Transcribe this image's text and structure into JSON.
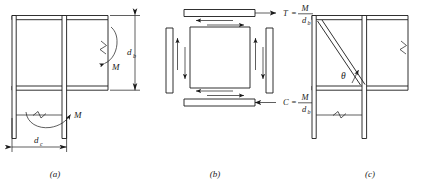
{
  "figure": {
    "type": "engineering-diagram",
    "panels": [
      {
        "id": "a",
        "label": "(a)",
        "caption_x": 63,
        "caption_y": 176,
        "annotations": [
          {
            "name": "beam-depth",
            "symbol": "d",
            "subscript": "b",
            "x": 131,
            "y": 52
          },
          {
            "name": "column-depth",
            "symbol": "d",
            "subscript": "c",
            "x": 57,
            "y": 144
          },
          {
            "name": "beam-moment",
            "symbol": "M",
            "subscript": "",
            "x": 113,
            "y": 66
          },
          {
            "name": "column-moment",
            "symbol": "M",
            "subscript": "",
            "x": 83,
            "y": 120
          }
        ]
      },
      {
        "id": "b",
        "label": "(b)",
        "caption_x": 215,
        "caption_y": 176,
        "annotations": [
          {
            "name": "tension-force",
            "lhs": "T",
            "rel": "=",
            "num": "M",
            "den": "d",
            "den_sub": "b",
            "x": 288,
            "y": 14
          },
          {
            "name": "compression-force",
            "lhs": "C",
            "rel": "=",
            "num": "M",
            "den": "d",
            "den_sub": "b",
            "x": 288,
            "y": 103
          }
        ]
      },
      {
        "id": "c",
        "label": "(c)",
        "caption_x": 370,
        "caption_y": 176,
        "annotations": [
          {
            "name": "brace-angle",
            "symbol": "θ",
            "x": 358,
            "y": 76
          }
        ]
      }
    ],
    "colors": {
      "line": "#1a1a1a",
      "background": "#ffffff",
      "fill": "#ffffff"
    }
  }
}
